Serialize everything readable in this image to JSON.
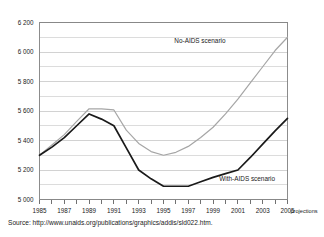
{
  "source": {
    "prefix": "Source:",
    "url": "http://www.unaids.org/publications/graphics/addis/sld022.htm."
  },
  "axis": {
    "projections_note": "projections",
    "y_tick_labels": [
      "6 200",
      "6 000",
      "5 800",
      "5 600",
      "5 400",
      "5 200",
      "5 000"
    ],
    "x_tick_labels": [
      "1985",
      "1987",
      "1989",
      "1991",
      "1993",
      "1995",
      "1997",
      "1999",
      "2001",
      "2003",
      "2005"
    ]
  },
  "colors": {
    "no_aids_line": "#a6a6a6",
    "with_aids_line": "#1a1a1a",
    "gridline": "#bfbfbf",
    "frame": "#808080",
    "background": "#ffffff"
  },
  "chart_data": {
    "type": "line",
    "title": "",
    "subtitle": "",
    "xlabel": "",
    "ylabel": "",
    "xlim": [
      1985,
      2005
    ],
    "ylim": [
      5000,
      6200
    ],
    "grid": true,
    "grid_minor_step": 100,
    "grid_major_step": 200,
    "legend": "inline-annotations",
    "x": [
      1985,
      1986,
      1987,
      1988,
      1989,
      1990,
      1991,
      1992,
      1993,
      1994,
      1995,
      1996,
      1997,
      1998,
      1999,
      2000,
      2001,
      2002,
      2003,
      2004,
      2005
    ],
    "series": [
      {
        "name": "No-AIDS scenario",
        "color": "#a6a6a6",
        "values": [
          5300,
          5370,
          5440,
          5530,
          5615,
          5615,
          5607,
          5470,
          5380,
          5325,
          5300,
          5320,
          5360,
          5420,
          5490,
          5580,
          5680,
          5790,
          5900,
          6010,
          6100
        ]
      },
      {
        "name": "With-AIDS scenario",
        "color": "#1a1a1a",
        "values": [
          5300,
          5355,
          5420,
          5500,
          5580,
          5545,
          5500,
          5350,
          5200,
          5140,
          5090,
          5090,
          5090,
          5120,
          5150,
          5175,
          5200,
          5285,
          5375,
          5465,
          5550
        ]
      }
    ],
    "annotations": [
      {
        "text": "No-AIDS scenario",
        "x": 2000,
        "y": 6060
      },
      {
        "text": "With-AIDS scenario",
        "x": 2004,
        "y": 5125
      }
    ]
  }
}
